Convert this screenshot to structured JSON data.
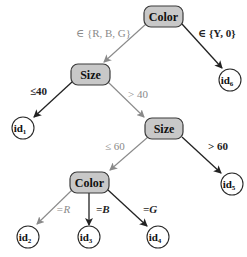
{
  "diagram": {
    "type": "decision-tree",
    "colors": {
      "decision_fill": "#c8c8c8",
      "dark_edge": "#222222",
      "gray_edge": "#8a8a8a"
    },
    "nodes": {
      "root": {
        "label": "Color"
      },
      "size1": {
        "label": "Size"
      },
      "size2": {
        "label": "Size"
      },
      "color2": {
        "label": "Color"
      },
      "leaf_id6": {
        "label": "id",
        "sub": "6"
      },
      "leaf_id1": {
        "label": "id",
        "sub": "1"
      },
      "leaf_id5": {
        "label": "id",
        "sub": "5"
      },
      "leaf_id2": {
        "label": "id",
        "sub": "2"
      },
      "leaf_id3": {
        "label": "id",
        "sub": "3"
      },
      "leaf_id4": {
        "label": "id",
        "sub": "4"
      }
    },
    "edges": {
      "root_to_size1": {
        "label": "∈ {R, B, G}",
        "style": "gray"
      },
      "root_to_id6": {
        "label": "∈ {Y, 0}",
        "style": "dark"
      },
      "size1_to_id1": {
        "label": "≤40",
        "style": "dark"
      },
      "size1_to_size2": {
        "label": "> 40",
        "style": "gray"
      },
      "size2_to_color2": {
        "label": "≤ 60",
        "style": "gray"
      },
      "size2_to_id5": {
        "label": "> 60",
        "style": "dark"
      },
      "color2_to_id2": {
        "label": "=R",
        "style": "gray"
      },
      "color2_to_id3": {
        "label": "=B",
        "style": "dark"
      },
      "color2_to_id4": {
        "label": "=G",
        "style": "dark"
      }
    }
  }
}
